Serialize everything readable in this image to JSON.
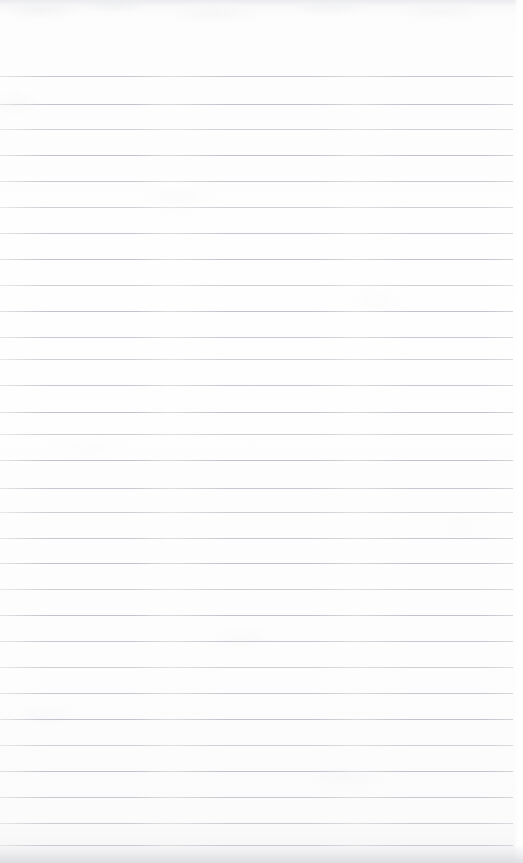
{
  "document": {
    "kind": "scanned-page",
    "title": "Scanned ruled notebook page",
    "description": "Blank lined paper, no handwriting or printed text present",
    "width_px": 523,
    "height_px": 863,
    "orientation": "portrait",
    "has_text_content": false,
    "written_content": "",
    "text_blocks": []
  },
  "paper": {
    "background_color": "#fdfdfd",
    "edge_tint_color": "#e4e5e9",
    "bottom_shadow_color": "#d6d7dc",
    "grain_color": "#b6b8be"
  },
  "ruling": {
    "style": "horizontal-ruled",
    "line_color": "#b9bcc4",
    "line_thickness_px": 1,
    "line_spacing_px": 26.3,
    "first_line_y_px": 76,
    "line_count": 30,
    "line_left_x_px": 0,
    "line_right_x_px": 513,
    "has_left_margin_rule": false,
    "has_header_rule": false,
    "top_blank_area_height_px": 76
  },
  "lines": [
    {
      "index": 1,
      "y": 76,
      "left": 0,
      "right": 513
    },
    {
      "index": 2,
      "y": 104,
      "left": 0,
      "right": 513
    },
    {
      "index": 3,
      "y": 129,
      "left": 0,
      "right": 513
    },
    {
      "index": 4,
      "y": 155,
      "left": 0,
      "right": 513
    },
    {
      "index": 5,
      "y": 181,
      "left": 0,
      "right": 513
    },
    {
      "index": 6,
      "y": 207,
      "left": 0,
      "right": 513
    },
    {
      "index": 7,
      "y": 233,
      "left": 0,
      "right": 513
    },
    {
      "index": 8,
      "y": 259,
      "left": 0,
      "right": 513
    },
    {
      "index": 9,
      "y": 285,
      "left": 0,
      "right": 513
    },
    {
      "index": 10,
      "y": 311,
      "left": 0,
      "right": 513
    },
    {
      "index": 11,
      "y": 337,
      "left": 0,
      "right": 513
    },
    {
      "index": 12,
      "y": 359,
      "left": 0,
      "right": 513
    },
    {
      "index": 13,
      "y": 385,
      "left": 0,
      "right": 513
    },
    {
      "index": 14,
      "y": 412,
      "left": 0,
      "right": 513
    },
    {
      "index": 15,
      "y": 434,
      "left": 0,
      "right": 513
    },
    {
      "index": 16,
      "y": 460,
      "left": 0,
      "right": 513
    },
    {
      "index": 17,
      "y": 488,
      "left": 0,
      "right": 513
    },
    {
      "index": 18,
      "y": 512,
      "left": 0,
      "right": 513
    },
    {
      "index": 19,
      "y": 538,
      "left": 0,
      "right": 513
    },
    {
      "index": 20,
      "y": 563,
      "left": 0,
      "right": 513
    },
    {
      "index": 21,
      "y": 589,
      "left": 0,
      "right": 513
    },
    {
      "index": 22,
      "y": 615,
      "left": 0,
      "right": 513
    },
    {
      "index": 23,
      "y": 641,
      "left": 0,
      "right": 513
    },
    {
      "index": 24,
      "y": 667,
      "left": 0,
      "right": 513
    },
    {
      "index": 25,
      "y": 693,
      "left": 0,
      "right": 513
    },
    {
      "index": 26,
      "y": 719,
      "left": 0,
      "right": 513
    },
    {
      "index": 27,
      "y": 745,
      "left": 0,
      "right": 513
    },
    {
      "index": 28,
      "y": 771,
      "left": 0,
      "right": 513
    },
    {
      "index": 29,
      "y": 797,
      "left": 0,
      "right": 513
    },
    {
      "index": 30,
      "y": 823,
      "left": 0,
      "right": 513
    },
    {
      "index": 31,
      "y": 845,
      "left": 0,
      "right": 513
    }
  ]
}
